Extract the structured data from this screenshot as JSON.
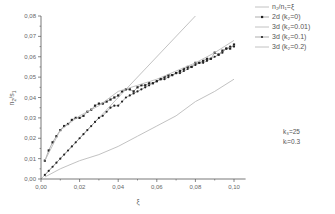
{
  "chart_data": {
    "type": "line",
    "title": "",
    "xlabel": "ξ",
    "ylabel": "n2/s1",
    "xlim": [
      0.0,
      0.105
    ],
    "ylim": [
      0.0,
      0.08
    ],
    "x_ticks": [
      "0,00",
      "0,02",
      "0,04",
      "0,06",
      "0,08",
      "0,10"
    ],
    "y_ticks": [
      "0,00",
      "0,01",
      "0,02",
      "0,03",
      "0,04",
      "0,05",
      "0,06",
      "0,07",
      "0,08"
    ],
    "grid": false,
    "legend_position": "upper right, outside plot",
    "series": [
      {
        "name": "n2/n1=ξ",
        "style": "solid-line",
        "color": "#bbbbbb",
        "x": [
          0.0,
          0.08
        ],
        "y": [
          0.0,
          0.08
        ]
      },
      {
        "name": "2d (k2=0)",
        "style": "line-with-square-markers",
        "color": "#222222",
        "x": [
          0.002,
          0.004,
          0.006,
          0.008,
          0.01,
          0.012,
          0.014,
          0.016,
          0.018,
          0.02,
          0.022,
          0.024,
          0.026,
          0.028,
          0.03,
          0.032,
          0.034,
          0.036,
          0.038,
          0.04,
          0.042,
          0.044,
          0.046,
          0.048,
          0.05,
          0.052,
          0.054,
          0.056,
          0.058,
          0.06,
          0.062,
          0.064,
          0.066,
          0.068,
          0.07,
          0.072,
          0.074,
          0.076,
          0.078,
          0.08,
          0.082,
          0.084,
          0.086,
          0.088,
          0.09,
          0.092,
          0.094,
          0.096,
          0.098,
          0.1
        ],
        "y": [
          0.009,
          0.014,
          0.018,
          0.021,
          0.024,
          0.026,
          0.027,
          0.029,
          0.03,
          0.03,
          0.031,
          0.033,
          0.034,
          0.036,
          0.037,
          0.037,
          0.038,
          0.039,
          0.04,
          0.041,
          0.043,
          0.044,
          0.044,
          0.043,
          0.045,
          0.046,
          0.046,
          0.047,
          0.047,
          0.048,
          0.049,
          0.05,
          0.051,
          0.051,
          0.052,
          0.053,
          0.054,
          0.055,
          0.055,
          0.057,
          0.057,
          0.058,
          0.059,
          0.059,
          0.062,
          0.061,
          0.063,
          0.064,
          0.064,
          0.066
        ]
      },
      {
        "name": "3d (k2=0.01)",
        "style": "light-line",
        "color": "#bbbbbb",
        "x": [
          0.002,
          0.01,
          0.02,
          0.03,
          0.04,
          0.05,
          0.06,
          0.07,
          0.08,
          0.09,
          0.1
        ],
        "y": [
          0.009,
          0.024,
          0.031,
          0.036,
          0.043,
          0.046,
          0.049,
          0.053,
          0.057,
          0.062,
          0.068
        ]
      },
      {
        "name": "3d (k2=0.1)",
        "style": "line-with-circle-markers",
        "color": "#222222",
        "x": [
          0.002,
          0.004,
          0.006,
          0.008,
          0.01,
          0.012,
          0.014,
          0.016,
          0.018,
          0.02,
          0.022,
          0.024,
          0.026,
          0.028,
          0.03,
          0.032,
          0.034,
          0.036,
          0.038,
          0.04,
          0.042,
          0.044,
          0.046,
          0.048,
          0.05,
          0.052,
          0.054,
          0.056,
          0.058,
          0.06,
          0.062,
          0.064,
          0.066,
          0.068,
          0.07,
          0.072,
          0.074,
          0.076,
          0.078,
          0.08,
          0.082,
          0.084,
          0.086,
          0.088,
          0.09,
          0.092,
          0.094,
          0.096,
          0.098,
          0.1
        ],
        "y": [
          0.002,
          0.004,
          0.006,
          0.008,
          0.01,
          0.012,
          0.014,
          0.016,
          0.018,
          0.02,
          0.022,
          0.024,
          0.026,
          0.028,
          0.03,
          0.031,
          0.033,
          0.035,
          0.036,
          0.036,
          0.038,
          0.04,
          0.041,
          0.042,
          0.043,
          0.044,
          0.045,
          0.046,
          0.047,
          0.048,
          0.049,
          0.049,
          0.05,
          0.051,
          0.052,
          0.052,
          0.053,
          0.054,
          0.055,
          0.056,
          0.057,
          0.057,
          0.058,
          0.059,
          0.06,
          0.061,
          0.062,
          0.064,
          0.065,
          0.065
        ]
      },
      {
        "name": "3d (k2=0.2)",
        "style": "light-line",
        "color": "#bbbbbb",
        "x": [
          0.002,
          0.01,
          0.02,
          0.03,
          0.04,
          0.05,
          0.06,
          0.07,
          0.08,
          0.09,
          0.1
        ],
        "y": [
          0.001,
          0.005,
          0.009,
          0.012,
          0.016,
          0.021,
          0.026,
          0.031,
          0.038,
          0.043,
          0.049
        ]
      }
    ],
    "annotations": [
      "k3=25",
      "ki=0.3"
    ]
  },
  "axes": {
    "xlabel": "ξ",
    "ylabel_main": "n",
    "ylabel_sub1": "2",
    "ylabel_mid": "/s",
    "ylabel_sub2": "1"
  },
  "legend": {
    "items": [
      {
        "label": "n₂/n₁=ξ"
      },
      {
        "label": "2d (k₂=0)"
      },
      {
        "label": "3d (k₂=0.01)"
      },
      {
        "label": "3d (k₂=0.1)"
      },
      {
        "label": "3d (k₂=0.2)"
      }
    ]
  },
  "params": {
    "line1": "k₃=25",
    "line2": "kᵢ=0.3"
  }
}
